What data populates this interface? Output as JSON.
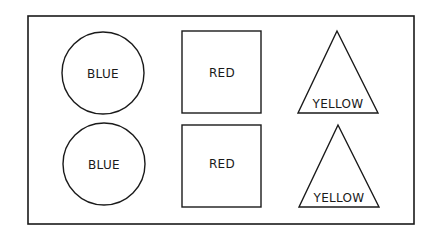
{
  "diagram": {
    "frame": {
      "x": 28,
      "y": 16,
      "width": 386,
      "height": 208
    },
    "stroke_color": "#1a1a1a",
    "rows": [
      {
        "circle": {
          "label": "BLUE",
          "cx": 103,
          "cy": 73,
          "r": 41
        },
        "square": {
          "label": "RED",
          "x": 182,
          "y": 31,
          "width": 79,
          "height": 82
        },
        "triangle": {
          "label": "YELLOW",
          "points": "337,31 298,113 378,113",
          "label_x": 338,
          "label_y": 107
        }
      },
      {
        "circle": {
          "label": "BLUE",
          "cx": 104,
          "cy": 164,
          "r": 41
        },
        "square": {
          "label": "RED",
          "x": 182,
          "y": 125,
          "width": 79,
          "height": 82
        },
        "triangle": {
          "label": "YELLOW",
          "points": "338,125 299,207 379,207",
          "label_x": 339,
          "label_y": 201
        }
      }
    ]
  }
}
